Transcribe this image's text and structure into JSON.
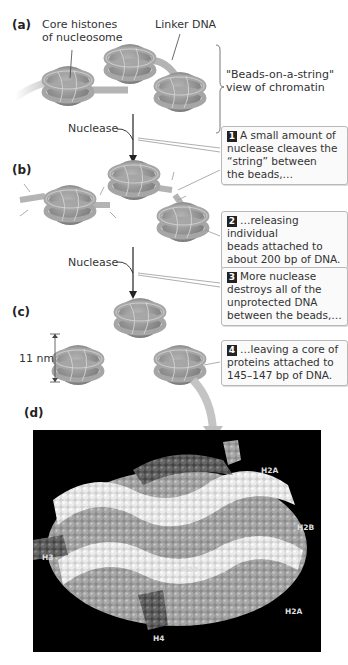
{
  "panels": {
    "a": {
      "label": "(a)",
      "core_histones_label": "Core histones of nucleosome",
      "core_histones_line1": "Core histones",
      "core_histones_line2": "of nucleosome",
      "linker_label": "Linker DNA",
      "bracket_line1": "\"Beads-on-a-string\"",
      "bracket_line2": "view of chromatin"
    },
    "b": {
      "label": "(b)",
      "nuclease_label": "Nuclease"
    },
    "c": {
      "label": "(c)",
      "nuclease_label": "Nuclease",
      "scale_label": "11 nm"
    },
    "d": {
      "label": "(d)",
      "histone_labels": [
        "H2A",
        "H2B",
        "H3",
        "H2B",
        "H2A",
        "H4"
      ]
    }
  },
  "callouts": [
    {
      "number": "1",
      "lines": [
        "A small amount of",
        "nuclease cleaves the",
        "“string” between",
        "the beads,…"
      ]
    },
    {
      "number": "2",
      "lines": [
        "…releasing individual",
        "beads attached to",
        "about 200 bp of DNA."
      ]
    },
    {
      "number": "3",
      "lines": [
        "More nuclease",
        "destroys all of the",
        "unprotected DNA",
        "between the beads,…"
      ]
    },
    {
      "number": "4",
      "lines": [
        "…leaving a core of",
        "proteins attached to",
        "145–147 bp of DNA."
      ]
    }
  ],
  "colors": {
    "bead": "#9a9a9a",
    "bead_dark": "#7a7a7a",
    "dna": "#b4b4b4",
    "callout_border": "#b9b9b9",
    "marker": "#222222",
    "background_panel_d": "#000000"
  }
}
